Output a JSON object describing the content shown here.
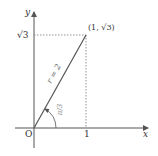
{
  "diagram": {
    "axes": {
      "x_label": "x",
      "y_label": "y",
      "origin_label": "O"
    },
    "ticks": {
      "x_tick": "1",
      "y_tick": "√3"
    },
    "point_label": "(1, √3)",
    "segment_label": "r = 2",
    "angle_label": "π/3",
    "colors": {
      "axis": "#555555",
      "segment": "#555555",
      "guide": "#777777"
    }
  }
}
